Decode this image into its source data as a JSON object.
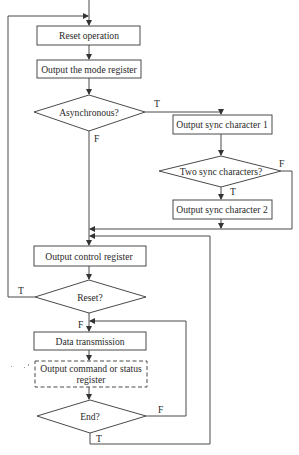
{
  "diagram": {
    "type": "flowchart",
    "colors": {
      "line": "#4a4a4a",
      "text": "#2a2a2a",
      "background": "#ffffff"
    },
    "nodes": {
      "reset_operation": {
        "label": "Reset operation",
        "shape": "process"
      },
      "output_mode_register": {
        "label": "Output the mode register",
        "shape": "process"
      },
      "asynchronous": {
        "label": "Asynchronous?",
        "shape": "decision"
      },
      "output_sync_char_1": {
        "label": "Output sync character 1",
        "shape": "process"
      },
      "two_sync_chars": {
        "label": "Two sync characters?",
        "shape": "decision"
      },
      "output_sync_char_2": {
        "label": "Output sync character 2",
        "shape": "process"
      },
      "output_control_register": {
        "label": "Output control register",
        "shape": "process"
      },
      "reset_check": {
        "label": "Reset?",
        "shape": "decision"
      },
      "data_transmission": {
        "label": "Data transmission",
        "shape": "process"
      },
      "output_cmd_status": {
        "label_line1": "Output command or status",
        "label_line2": "register",
        "shape": "process-optional-dashed"
      },
      "end_check": {
        "label": "End?",
        "shape": "decision"
      }
    },
    "edge_labels": {
      "async_true": "T",
      "async_false": "F",
      "two_sync_true": "T",
      "two_sync_false": "F",
      "reset_true": "T",
      "reset_false": "F",
      "end_false": "F",
      "end_true": "T"
    },
    "edges": [
      {
        "from": "start",
        "to": "reset_operation"
      },
      {
        "from": "reset_operation",
        "to": "output_mode_register"
      },
      {
        "from": "output_mode_register",
        "to": "asynchronous"
      },
      {
        "from": "asynchronous",
        "to": "output_sync_char_1",
        "label": "T"
      },
      {
        "from": "asynchronous",
        "to": "output_control_register",
        "label": "F"
      },
      {
        "from": "output_sync_char_1",
        "to": "two_sync_chars"
      },
      {
        "from": "two_sync_chars",
        "to": "output_sync_char_2",
        "label": "T"
      },
      {
        "from": "two_sync_chars",
        "to": "output_control_register",
        "label": "F"
      },
      {
        "from": "output_sync_char_2",
        "to": "output_control_register"
      },
      {
        "from": "output_control_register",
        "to": "reset_check"
      },
      {
        "from": "reset_check",
        "to": "reset_operation",
        "label": "T"
      },
      {
        "from": "reset_check",
        "to": "data_transmission",
        "label": "F"
      },
      {
        "from": "data_transmission",
        "to": "output_cmd_status"
      },
      {
        "from": "output_cmd_status",
        "to": "end_check"
      },
      {
        "from": "end_check",
        "to": "data_transmission",
        "label": "F"
      },
      {
        "from": "end_check",
        "to": "output_control_register",
        "label": "T"
      }
    ]
  }
}
